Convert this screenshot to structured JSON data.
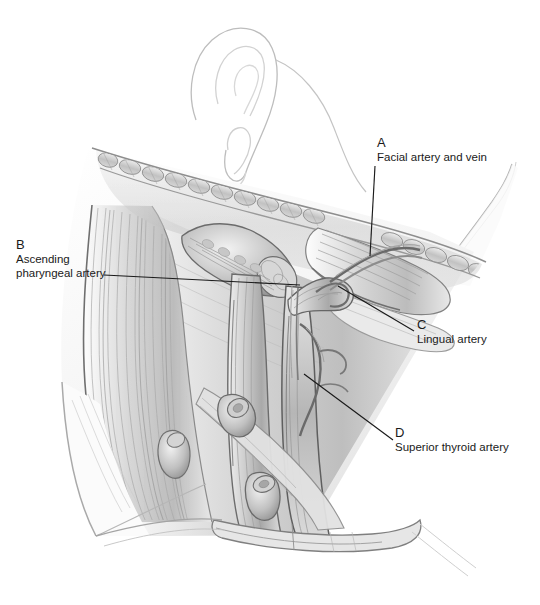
{
  "figure": {
    "medium": "graphite pencil drawing",
    "background_color": "#ffffff",
    "ink_color": "#1a1a1a",
    "view": "right lateral view of head and neck",
    "labels": [
      {
        "key": "A",
        "text": "Facial artery and vein",
        "label_x": 377,
        "label_y": 136,
        "leader": {
          "x1": 375,
          "y1": 166,
          "x2": 370,
          "y2": 256
        }
      },
      {
        "key": "B",
        "text_line1": "Ascending",
        "text_line2": "pharyngeal artery",
        "label_x": 16,
        "label_y": 238,
        "leader": {
          "x1": 104,
          "y1": 275,
          "x2": 300,
          "y2": 285
        }
      },
      {
        "key": "C",
        "text": "Lingual artery",
        "label_x": 417,
        "label_y": 318,
        "leader": {
          "x1": 338,
          "y1": 286,
          "x2": 414,
          "y2": 331
        }
      },
      {
        "key": "D",
        "text": "Superior thyroid artery",
        "label_x": 395,
        "label_y": 426,
        "leader": {
          "x1": 304,
          "y1": 374,
          "x2": 393,
          "y2": 440
        }
      }
    ],
    "structures": [
      "auricle (ear)",
      "mandible with submandibular lymph node chain",
      "parotid region",
      "sternocleidomastoid muscle",
      "cut muscle stumps",
      "common carotid artery",
      "internal jugular vein",
      "external carotid artery branches",
      "cut vessel stumps",
      "clavicle band"
    ]
  }
}
